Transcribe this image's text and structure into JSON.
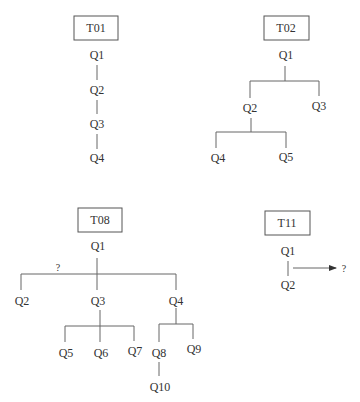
{
  "trees": [
    {
      "id": "T01",
      "title": "T01",
      "nodes": [
        "Q1",
        "Q2",
        "Q3",
        "Q4"
      ]
    },
    {
      "id": "T02",
      "title": "T02",
      "nodes": [
        "Q1",
        "Q2",
        "Q3",
        "Q4",
        "Q5"
      ]
    },
    {
      "id": "T08",
      "title": "T08",
      "nodes": [
        "Q1",
        "Q2",
        "Q3",
        "Q4",
        "Q5",
        "Q6",
        "Q7",
        "Q8",
        "Q9",
        "Q10"
      ],
      "annotation": "?"
    },
    {
      "id": "T11",
      "title": "T11",
      "nodes": [
        "Q1",
        "Q2"
      ],
      "arrow_target": "?"
    }
  ]
}
